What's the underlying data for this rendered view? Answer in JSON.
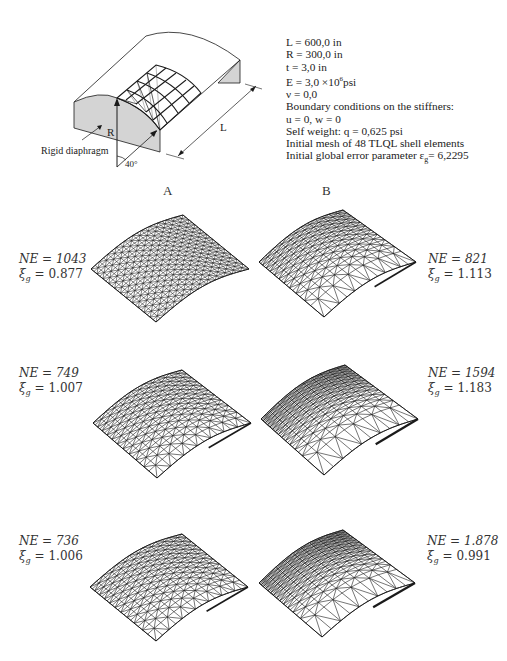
{
  "schematic": {
    "labels": {
      "diaphragm": "Rigid diaphragm",
      "radius": "R",
      "length": "L",
      "angle": "40°"
    }
  },
  "parameters": [
    "L = 600,0 in",
    "R = 300,0 in",
    "t = 3,0 in",
    "E = 3,0 ×10",
    "ν = 0,0",
    "Boundary conditions on the stiffners:",
    "u = 0,  w = 0",
    "Self weight:  q = 0,625 psi",
    "Initial mesh of 48 TLQL shell elements",
    "Initial global error parameter  ε"
  ],
  "param_extras": {
    "E_exponent": "6",
    "E_unit": "psi",
    "eps_subscript": "g",
    "eps_value": "= 6,2295"
  },
  "columns": [
    "A",
    "B"
  ],
  "meshes": [
    {
      "column": "A",
      "row": 1,
      "NE_label": "NE = 1043",
      "xi_label": "ξg = 0.877",
      "NE": 1043,
      "xi_g": 0.877,
      "refine": "uniform-fine"
    },
    {
      "column": "B",
      "row": 1,
      "NE_label": "NE = 821",
      "xi_label": "ξg = 1.113",
      "NE": 821,
      "xi_g": 1.113,
      "refine": "graded"
    },
    {
      "column": "A",
      "row": 2,
      "NE_label": "NE = 749",
      "xi_label": "ξg = 1.007",
      "NE": 749,
      "xi_g": 1.007,
      "refine": "mild-graded"
    },
    {
      "column": "B",
      "row": 2,
      "NE_label": "NE = 1594",
      "xi_label": "ξg = 1.183",
      "NE": 1594,
      "xi_g": 1.183,
      "refine": "strong-graded"
    },
    {
      "column": "A",
      "row": 3,
      "NE_label": "NE = 736",
      "xi_label": "ξg = 1.006",
      "NE": 736,
      "xi_g": 1.006,
      "refine": "mild-graded"
    },
    {
      "column": "B",
      "row": 3,
      "NE_label": "NE = 1.878",
      "xi_label": "ξg = 0.991",
      "NE": 1878,
      "xi_g": 0.991,
      "refine": "strong-graded"
    }
  ],
  "text": {
    "ne": [
      "NE = 1043",
      "NE = 821",
      "NE = 749",
      "NE = 1594",
      "NE = 736",
      "NE = 1.878"
    ],
    "xi_val": [
      "= 0.877",
      "= 1.113",
      "= 1.007",
      "= 1.183",
      "= 1.006",
      "= 0.991"
    ]
  },
  "colors": {
    "stroke": "#1a1a1a",
    "diaphragm_fill": "#d4d4d4",
    "background": "#ffffff"
  }
}
